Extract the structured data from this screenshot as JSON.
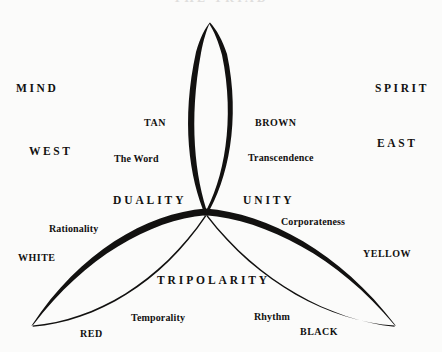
{
  "figure": {
    "title": "THE TRIAD",
    "type": "trefoil-venn-diagram",
    "background_color": "#fbfbfa",
    "ink_color": "#121110",
    "center_node": {
      "x": 205,
      "y": 215
    }
  },
  "axis_labels": [
    {
      "id": "mind",
      "text": "MIND",
      "x": 16,
      "y": 83,
      "style": "axis-word"
    },
    {
      "id": "spirit",
      "text": "SPIRIT",
      "x": 375,
      "y": 83,
      "style": "axis-word"
    },
    {
      "id": "west",
      "text": "WEST",
      "x": 29,
      "y": 146,
      "style": "axis-word"
    },
    {
      "id": "east",
      "text": "EAST",
      "x": 377,
      "y": 138,
      "style": "axis-word"
    }
  ],
  "concept_labels": [
    {
      "id": "duality",
      "text": "DUALITY",
      "x": 113,
      "y": 195,
      "style": "concept-word"
    },
    {
      "id": "unity",
      "text": "UNITY",
      "x": 243,
      "y": 195,
      "style": "concept-word"
    },
    {
      "id": "tripolarity",
      "text": "TRIPOLARITY",
      "x": 157,
      "y": 275,
      "style": "concept-word"
    }
  ],
  "color_labels": [
    {
      "id": "tan",
      "text": "TAN",
      "x": 144,
      "y": 118,
      "style": "color-word"
    },
    {
      "id": "brown",
      "text": "BROWN",
      "x": 255,
      "y": 118,
      "style": "color-word"
    },
    {
      "id": "white",
      "text": "WHITE",
      "x": 18,
      "y": 253,
      "style": "color-word"
    },
    {
      "id": "yellow",
      "text": "YELLOW",
      "x": 363,
      "y": 249,
      "style": "color-word"
    },
    {
      "id": "red",
      "text": "RED",
      "x": 80,
      "y": 329,
      "style": "color-word"
    },
    {
      "id": "black",
      "text": "BLACK",
      "x": 300,
      "y": 327,
      "style": "color-word"
    }
  ],
  "attribute_labels": [
    {
      "id": "the-word",
      "text": "The Word",
      "x": 114,
      "y": 154,
      "style": "attr-word"
    },
    {
      "id": "transcendence",
      "text": "Transcendence",
      "x": 248,
      "y": 153,
      "style": "attr-word"
    },
    {
      "id": "rationality",
      "text": "Rationality",
      "x": 49,
      "y": 224,
      "style": "attr-word"
    },
    {
      "id": "corporateness",
      "text": "Corporateness",
      "x": 281,
      "y": 217,
      "style": "attr-word"
    },
    {
      "id": "temporality",
      "text": "Temporality",
      "x": 131,
      "y": 313,
      "style": "attr-word"
    },
    {
      "id": "rhythm",
      "text": "Rhythm",
      "x": 254,
      "y": 312,
      "style": "attr-word"
    }
  ]
}
